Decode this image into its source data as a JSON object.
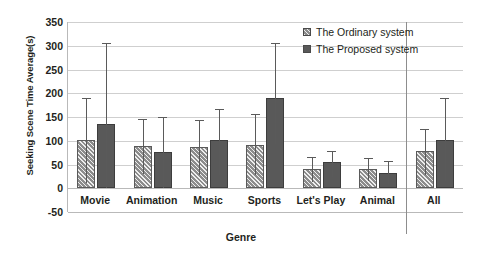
{
  "chart_data": {
    "type": "bar",
    "title": "",
    "xlabel": "Genre",
    "ylabel": "Seeking Scene Time Average(s)",
    "categories": [
      "Movie",
      "Animation",
      "Music",
      "Sports",
      "Let's Play",
      "Animal",
      "All"
    ],
    "ylim": [
      -50,
      350
    ],
    "yticks": [
      -50,
      0,
      50,
      100,
      150,
      200,
      250,
      300,
      350
    ],
    "ytick_labels": [
      "-50",
      "0",
      "50",
      "100",
      "150",
      "200",
      "250",
      "300",
      "350"
    ],
    "grid": true,
    "legend_position": "top-right",
    "series": [
      {
        "name": "The Ordinary system",
        "color": "#8c8c8c",
        "pattern": "diagonal-hatch",
        "values": [
          102,
          90,
          87,
          92,
          41,
          40,
          78
        ],
        "err_upper": [
          88,
          55,
          57,
          64,
          24,
          23,
          47
        ],
        "err_lower": [
          90,
          60,
          60,
          65,
          27,
          24,
          50
        ]
      },
      {
        "name": "The Proposed system",
        "color": "#595959",
        "pattern": "solid",
        "values": [
          135,
          77,
          101,
          190,
          56,
          33,
          101
        ],
        "err_upper": [
          170,
          73,
          65,
          115,
          23,
          25,
          89
        ],
        "err_lower": [
          134,
          76,
          74,
          96,
          33,
          25,
          85
        ]
      }
    ]
  },
  "legend": {
    "items": [
      {
        "label": "The Ordinary system"
      },
      {
        "label": "The Proposed system"
      }
    ]
  }
}
